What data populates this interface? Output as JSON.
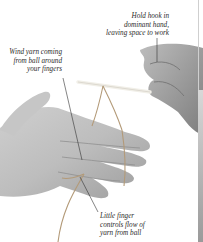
{
  "illustration": {
    "subject": "Holding a crochet hook and yarn",
    "annotations": [
      {
        "id": "hold",
        "lines": [
          "Hold hook in",
          "dominant hand,",
          "leaving space to work"
        ]
      },
      {
        "id": "wind",
        "lines": [
          "Wind yarn coming",
          "from ball around",
          "your fingers"
        ]
      },
      {
        "id": "little",
        "lines": [
          "Little finger",
          "controls flow of",
          "yarn from ball"
        ]
      }
    ],
    "colors": {
      "background": "#ffffff",
      "skin_light": "#d9d9d9",
      "skin_mid": "#b5b5b5",
      "skin_dark": "#8a8a8a",
      "yarn": "#b39a78",
      "hook": "#f1efe8",
      "leader_line": "#333333"
    }
  }
}
